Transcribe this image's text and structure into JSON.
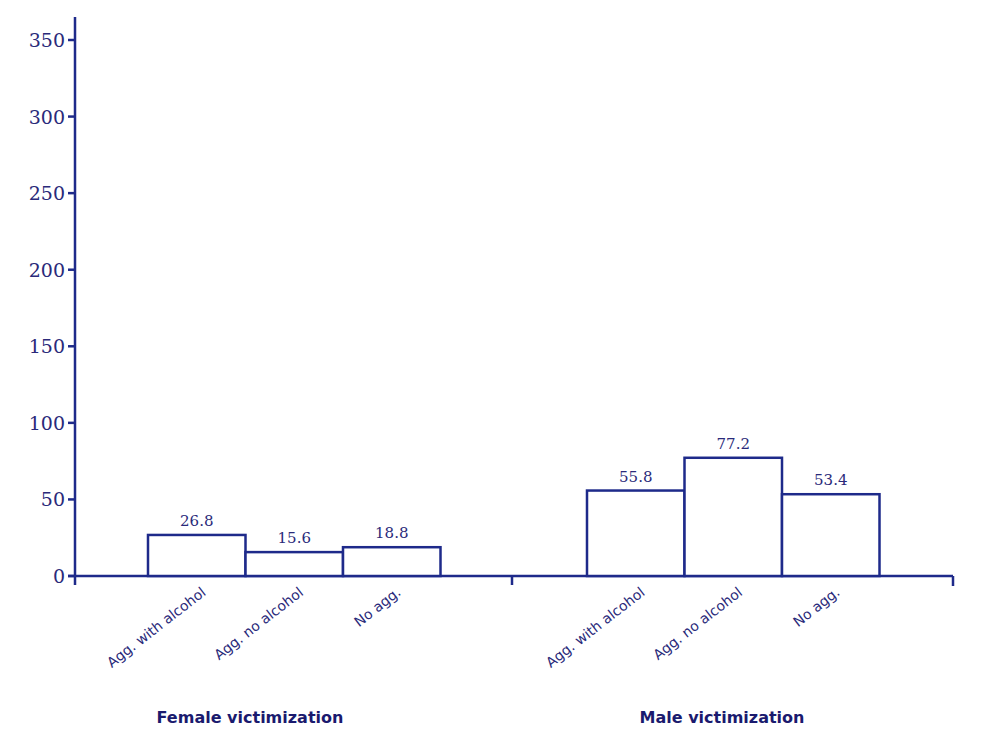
{
  "chart_data": {
    "type": "bar",
    "title": "",
    "xlabel": "",
    "ylabel": "",
    "ylim": [
      0,
      350
    ],
    "yticks": [
      0,
      50,
      100,
      150,
      200,
      250,
      300,
      350
    ],
    "grid": false,
    "legend": null,
    "groups": [
      {
        "name": "Female  victimization",
        "categories": [
          "Agg. with alcohol",
          "Agg. no alcohol",
          "No agg."
        ],
        "values": [
          26.8,
          15.6,
          18.8
        ],
        "value_labels": [
          "26.8",
          "15.6",
          "18.8"
        ]
      },
      {
        "name": "Male victimization",
        "categories": [
          "Agg. with alcohol",
          "Agg. no alcohol",
          "No agg."
        ],
        "values": [
          55.8,
          77.2,
          53.4
        ],
        "value_labels": [
          "55.8",
          "77.2",
          "53.4"
        ]
      }
    ],
    "colors": {
      "line": "#1e2a8a",
      "text": "#2a2a7a",
      "bar_fill": "#ffffff"
    }
  }
}
